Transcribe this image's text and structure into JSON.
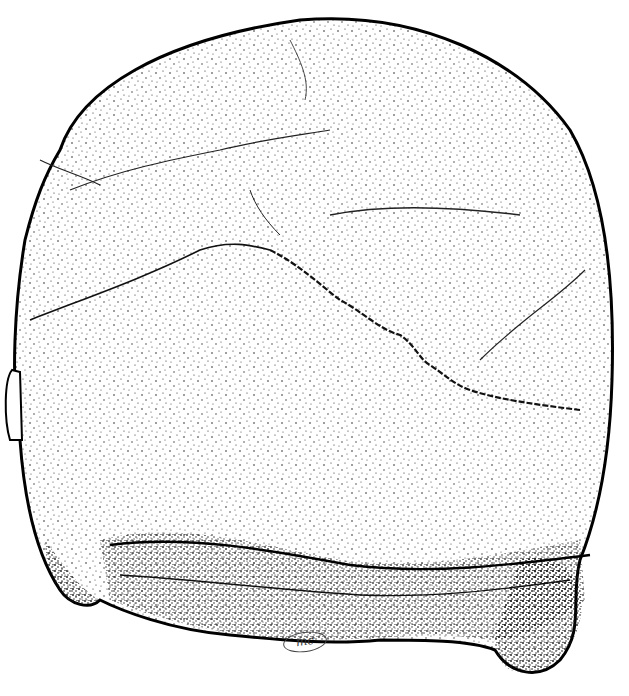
{
  "illustration": {
    "subject": "skull posterior view",
    "style": "stipple ink drawing",
    "signature": "mc",
    "colors": {
      "ink": "#111111",
      "paper": "#ffffff",
      "shade": "#555555"
    }
  }
}
